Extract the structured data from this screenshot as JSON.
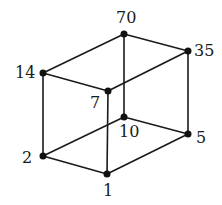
{
  "vertices": [
    {
      "id": "70",
      "label": "70",
      "x": 124,
      "y": 34
    },
    {
      "id": "35",
      "label": "35",
      "x": 188,
      "y": 51
    },
    {
      "id": "14",
      "label": "14",
      "x": 43,
      "y": 73
    },
    {
      "id": "7",
      "label": "7",
      "x": 108,
      "y": 91
    },
    {
      "id": "10",
      "label": "10",
      "x": 124,
      "y": 117
    },
    {
      "id": "5",
      "label": "5",
      "x": 188,
      "y": 134
    },
    {
      "id": "2",
      "label": "2",
      "x": 43,
      "y": 156
    },
    {
      "id": "1",
      "label": "1",
      "x": 107,
      "y": 174
    }
  ],
  "edges": [
    [
      "70",
      "35"
    ],
    [
      "70",
      "14"
    ],
    [
      "70",
      "10"
    ],
    [
      "35",
      "7"
    ],
    [
      "35",
      "5"
    ],
    [
      "14",
      "7"
    ],
    [
      "14",
      "2"
    ],
    [
      "7",
      "1"
    ],
    [
      "10",
      "5"
    ],
    [
      "10",
      "2"
    ],
    [
      "5",
      "1"
    ],
    [
      "2",
      "1"
    ]
  ],
  "colors": {
    "line": "#1a1a1a",
    "node": "#111111"
  }
}
